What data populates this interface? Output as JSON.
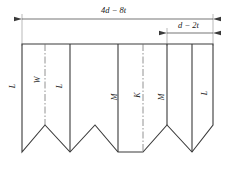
{
  "drawing": {
    "title": "sheet-metal blank development",
    "line_color": "#3a3a3a",
    "text_color": "#1a1a1a",
    "background": "#ffffff"
  },
  "dimensions": [
    {
      "id": "overall-width",
      "label": "4d − 8t",
      "position": "top",
      "arrows": "both"
    },
    {
      "id": "right-panel-width",
      "label": "d − 2t",
      "position": "top-right",
      "arrows": "both"
    }
  ],
  "segments": [
    {
      "id": "seg-1",
      "label": "L"
    },
    {
      "id": "seg-2",
      "label": "W"
    },
    {
      "id": "seg-3",
      "label": "L"
    },
    {
      "id": "seg-4",
      "label": "M"
    },
    {
      "id": "seg-5",
      "label": "K"
    },
    {
      "id": "seg-6",
      "label": "M"
    },
    {
      "id": "seg-7",
      "label": "L"
    }
  ],
  "geometry": {
    "top_edge_y": 44,
    "outline_points": "22,44 213,44 213,125 192,152 167,125 143,152 118,152 95,125 70,152 45,125 22,152",
    "divider_x": [
      45,
      70,
      118,
      143,
      167,
      192
    ],
    "centerline_x": [
      45,
      143
    ]
  }
}
